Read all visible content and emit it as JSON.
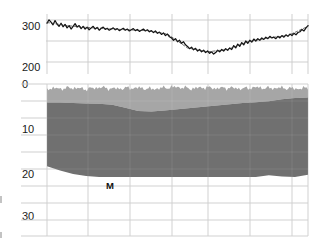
{
  "figure": {
    "width": 314,
    "height": 245,
    "background": "#ffffff",
    "grid_color": "#c9c9c9",
    "axis_text_color": "#1a1a1a"
  },
  "top_panel": {
    "name": "sea-surface-elevation-timeseries",
    "y_ticks": [
      "300",
      "200"
    ],
    "y_tick_values": [
      300,
      200
    ],
    "plot_rect": {
      "x": 47,
      "y": 14,
      "width": 261,
      "height": 54
    },
    "gridlines_x": [
      47,
      88,
      130,
      172,
      208,
      250,
      292,
      308
    ],
    "gridlines_y": [
      20,
      41,
      62
    ],
    "series": [
      {
        "name": "record-primary",
        "color": "#111111",
        "width": 1.3,
        "dash": "none"
      },
      {
        "name": "record-secondary",
        "color": "#333333",
        "width": 0.7,
        "dash": "2 2"
      }
    ]
  },
  "bottom_panel": {
    "name": "depth-profile-cross-section",
    "y_ticks": [
      "0",
      "10",
      "20",
      "30"
    ],
    "y_tick_values": [
      0,
      10,
      20,
      30
    ],
    "plot_rect": {
      "x": 47,
      "y": 84,
      "width": 261,
      "height": 152
    },
    "gridlines_x": [
      47,
      88,
      130,
      172,
      208,
      250,
      292,
      308
    ],
    "gridlines_y": [
      84,
      101,
      118,
      135,
      152,
      169,
      186,
      203,
      220,
      236
    ],
    "layers": [
      {
        "name": "upper-sediment-layer",
        "color": "#a6a6a6",
        "label": ""
      },
      {
        "name": "lower-basement-layer",
        "color": "#707070",
        "label": "M"
      }
    ],
    "annotation": {
      "text": "M",
      "x": 106,
      "y": 181
    }
  },
  "chart_data": {
    "type": "line",
    "title": "",
    "subtitle": "",
    "xlabel": "",
    "ylabel": "",
    "panels": [
      {
        "id": "top",
        "type": "line",
        "ylabel": "",
        "ylim": [
          180,
          320
        ],
        "yticks": [
          300,
          200
        ],
        "grid": true,
        "legend": "none",
        "series": [
          {
            "name": "record-primary",
            "color": "#111111",
            "x": [
              0,
              1,
              2,
              3,
              4,
              5,
              6,
              7,
              8,
              9,
              10,
              11,
              12,
              13,
              14,
              15,
              16,
              17,
              18,
              19,
              20,
              21,
              22,
              23,
              24,
              25,
              26,
              27,
              28,
              29,
              30,
              31,
              32,
              33,
              34,
              35,
              36,
              37,
              38,
              39,
              40,
              41,
              42,
              43,
              44,
              45,
              46,
              47,
              48,
              49,
              50,
              51,
              52,
              53,
              54,
              55,
              56,
              57,
              58,
              59,
              60,
              61,
              62,
              63,
              64,
              65,
              66,
              67,
              68,
              69,
              70,
              71,
              72,
              73,
              74,
              75,
              76,
              77,
              78,
              79,
              80,
              81,
              82,
              83,
              84,
              85,
              86,
              87,
              88,
              89,
              90,
              91,
              92,
              93,
              94,
              95,
              96,
              97,
              98,
              99,
              100,
              101,
              102,
              103,
              104,
              105,
              106,
              107,
              108,
              109,
              110,
              111,
              112,
              113,
              114,
              115,
              116,
              117,
              118,
              119,
              120,
              121,
              122,
              123,
              124,
              125,
              126,
              127,
              128,
              129,
              130
            ],
            "values": [
              296,
              305,
              299,
              292,
              303,
              294,
              288,
              296,
              287,
              293,
              284,
              290,
              281,
              288,
              295,
              286,
              290,
              282,
              288,
              281,
              286,
              279,
              284,
              288,
              281,
              285,
              278,
              283,
              286,
              280,
              283,
              278,
              281,
              284,
              279,
              282,
              277,
              280,
              283,
              278,
              281,
              276,
              279,
              282,
              277,
              280,
              275,
              278,
              281,
              276,
              279,
              274,
              277,
              272,
              276,
              270,
              273,
              267,
              271,
              264,
              268,
              261,
              258,
              252,
              256,
              248,
              252,
              244,
              248,
              240,
              236,
              230,
              234,
              227,
              231,
              224,
              228,
              222,
              226,
              220,
              224,
              218,
              222,
              216,
              220,
              226,
              222,
              228,
              224,
              230,
              226,
              232,
              228,
              238,
              232,
              242,
              236,
              246,
              240,
              250,
              244,
              252,
              247,
              255,
              250,
              256,
              252,
              258,
              254,
              260,
              256,
              262,
              258,
              260,
              256,
              262,
              258,
              264,
              260,
              266,
              262,
              268,
              264,
              270,
              266,
              272,
              274,
              280,
              276,
              284,
              290
            ]
          },
          {
            "name": "record-secondary",
            "color": "#333333",
            "x": [
              0,
              10,
              20,
              30,
              40,
              50,
              60,
              70,
              80,
              90,
              100,
              110,
              120,
              130
            ],
            "values": [
              298,
              290,
              285,
              282,
              279,
              277,
              268,
              232,
              222,
              228,
              248,
              258,
              264,
              288
            ]
          }
        ]
      },
      {
        "id": "bottom",
        "type": "area",
        "ylabel": "",
        "ylim": [
          0,
          36
        ],
        "yticks": [
          0,
          10,
          20,
          30
        ],
        "inverted_y": true,
        "grid": true,
        "legend": "none",
        "x": [
          0,
          5,
          10,
          15,
          20,
          25,
          30,
          35,
          40,
          45,
          50,
          55,
          60,
          65,
          70,
          75,
          80,
          85,
          90,
          95,
          100
        ],
        "series": [
          {
            "name": "seafloor-top",
            "color": "#a6a6a6",
            "values": [
              1.0,
              1.1,
              0.9,
              1.2,
              0.8,
              1.1,
              1.0,
              0.9,
              1.2,
              0.9,
              0.7,
              1.1,
              0.8,
              1.0,
              0.9,
              1.1,
              0.8,
              1.0,
              0.9,
              1.1,
              1.0
            ]
          },
          {
            "name": "basement-top",
            "color": "#707070",
            "values": [
              4.4,
              4.4,
              4.5,
              4.6,
              4.7,
              4.9,
              5.6,
              6.4,
              6.5,
              6.3,
              6.0,
              5.7,
              5.4,
              5.1,
              4.8,
              4.5,
              4.3,
              4.1,
              3.6,
              3.3,
              3.2
            ]
          },
          {
            "name": "moho-base",
            "color": "#707070",
            "values": [
              19.5,
              20.5,
              21.3,
              21.8,
              22.0,
              22.0,
              22.0,
              22.0,
              22.0,
              22.0,
              22.0,
              22.0,
              22.0,
              22.0,
              22.0,
              22.0,
              22.0,
              21.6,
              21.9,
              22.0,
              21.5
            ]
          }
        ]
      }
    ]
  }
}
